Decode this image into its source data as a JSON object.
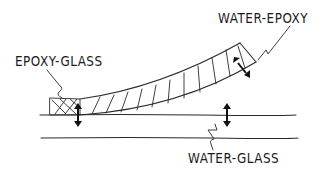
{
  "diagram": {
    "type": "hand-drawn schematic",
    "labels": {
      "epoxy_glass": "EPOXY-GLASS",
      "water_epoxy": "WATER-EPOXY",
      "water_glass": "WATER-GLASS"
    },
    "elements": [
      {
        "name": "glass-substrate",
        "description": "two parallel horizontal lines"
      },
      {
        "name": "epoxy-layer",
        "description": "hatched layer peeling upward from left to right"
      },
      {
        "name": "epoxy-glass-interface",
        "description": "cross-hatched bonded region at left"
      },
      {
        "name": "double-arrow-epoxy-glass",
        "description": "vertical double arrow at bonded interface"
      },
      {
        "name": "double-arrow-water-epoxy",
        "description": "diagonal double arrow at peeled tip"
      },
      {
        "name": "double-arrow-water-glass",
        "description": "vertical double arrow above glass surface"
      }
    ],
    "colors": {
      "ink": "#2a2a2a",
      "background": "#ffffff"
    }
  }
}
